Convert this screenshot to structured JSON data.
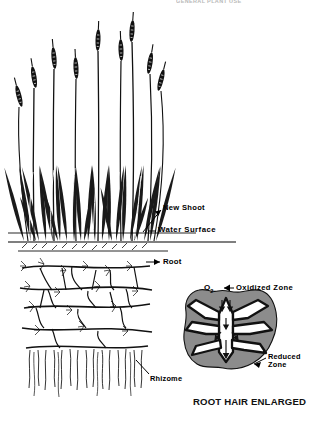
{
  "header": {
    "title": "GENERAL PLANT USE"
  },
  "figure": {
    "caption": "ROOT HAIR ENLARGED",
    "ink_color": "#000000",
    "background_color": "#ffffff",
    "reduced_zone_fill": "#8c8c8c",
    "labels": {
      "new_shoot": "New Shoot",
      "water_surface": "Water Surface",
      "root": "Root",
      "rhizome": "Rhizome",
      "oxygen": "O",
      "oxygen_subscript": "2",
      "oxidized_zone": "Oxidized Zone",
      "reduced_zone_line1": "Reduced",
      "reduced_zone_line2": "Zone"
    }
  }
}
